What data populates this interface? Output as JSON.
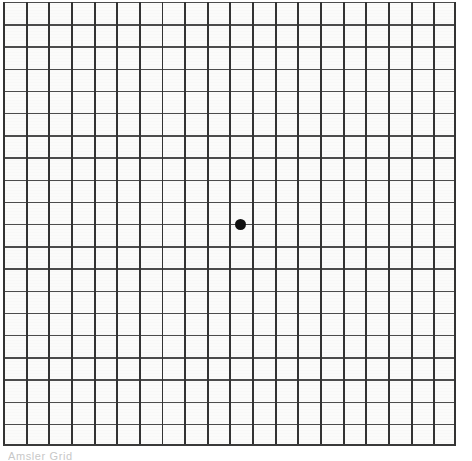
{
  "document": {
    "title": "Amsler Grid",
    "background_color": "#ffffff",
    "paper_color": "#fbfbfa"
  },
  "grid": {
    "name": "amsler-grid",
    "columns": 20,
    "rows": 20,
    "cell_width_px": 22.65,
    "cell_height_px": 22.2,
    "line_color_vertical": "#333333",
    "line_color_horizontal": "#4c4c4c",
    "left_px": 3,
    "top_px": 2,
    "width_px": 453,
    "height_px": 444
  },
  "fixation_dot": {
    "name": "center-fixation-dot",
    "color": "#111111",
    "diameter_px": 11,
    "center_x_px": 240,
    "center_y_px": 224
  },
  "caption": {
    "text": "Amsler Grid",
    "color": "#9a9a9a",
    "clipped": true
  },
  "chart_data": {
    "type": "heatmap",
    "title": "Amsler Grid",
    "xlabel": "",
    "ylabel": "",
    "categories": [
      "c1",
      "c2",
      "c3",
      "c4",
      "c5",
      "c6",
      "c7",
      "c8",
      "c9",
      "c10",
      "c11",
      "c12",
      "c13",
      "c14",
      "c15",
      "c16",
      "c17",
      "c18",
      "c19",
      "c20"
    ],
    "rows": [
      "r1",
      "r2",
      "r3",
      "r4",
      "r5",
      "r6",
      "r7",
      "r8",
      "r9",
      "r10",
      "r11",
      "r12",
      "r13",
      "r14",
      "r15",
      "r16",
      "r17",
      "r18",
      "r19",
      "r20"
    ],
    "grid": true,
    "legend": "none",
    "annotations": [
      {
        "label": "central fixation dot",
        "x": 10,
        "y": 10,
        "marker": "filled-circle",
        "color": "#111111"
      }
    ],
    "xlim": [
      0,
      20
    ],
    "ylim": [
      0,
      20
    ],
    "values": [
      [
        0,
        0,
        0,
        0,
        0,
        0,
        0,
        0,
        0,
        0,
        0,
        0,
        0,
        0,
        0,
        0,
        0,
        0,
        0,
        0
      ],
      [
        0,
        0,
        0,
        0,
        0,
        0,
        0,
        0,
        0,
        0,
        0,
        0,
        0,
        0,
        0,
        0,
        0,
        0,
        0,
        0
      ],
      [
        0,
        0,
        0,
        0,
        0,
        0,
        0,
        0,
        0,
        0,
        0,
        0,
        0,
        0,
        0,
        0,
        0,
        0,
        0,
        0
      ],
      [
        0,
        0,
        0,
        0,
        0,
        0,
        0,
        0,
        0,
        0,
        0,
        0,
        0,
        0,
        0,
        0,
        0,
        0,
        0,
        0
      ],
      [
        0,
        0,
        0,
        0,
        0,
        0,
        0,
        0,
        0,
        0,
        0,
        0,
        0,
        0,
        0,
        0,
        0,
        0,
        0,
        0
      ],
      [
        0,
        0,
        0,
        0,
        0,
        0,
        0,
        0,
        0,
        0,
        0,
        0,
        0,
        0,
        0,
        0,
        0,
        0,
        0,
        0
      ],
      [
        0,
        0,
        0,
        0,
        0,
        0,
        0,
        0,
        0,
        0,
        0,
        0,
        0,
        0,
        0,
        0,
        0,
        0,
        0,
        0
      ],
      [
        0,
        0,
        0,
        0,
        0,
        0,
        0,
        0,
        0,
        0,
        0,
        0,
        0,
        0,
        0,
        0,
        0,
        0,
        0,
        0
      ],
      [
        0,
        0,
        0,
        0,
        0,
        0,
        0,
        0,
        0,
        0,
        0,
        0,
        0,
        0,
        0,
        0,
        0,
        0,
        0,
        0
      ],
      [
        0,
        0,
        0,
        0,
        0,
        0,
        0,
        0,
        0,
        0,
        1,
        0,
        0,
        0,
        0,
        0,
        0,
        0,
        0,
        0
      ],
      [
        0,
        0,
        0,
        0,
        0,
        0,
        0,
        0,
        0,
        0,
        0,
        0,
        0,
        0,
        0,
        0,
        0,
        0,
        0,
        0
      ],
      [
        0,
        0,
        0,
        0,
        0,
        0,
        0,
        0,
        0,
        0,
        0,
        0,
        0,
        0,
        0,
        0,
        0,
        0,
        0,
        0
      ],
      [
        0,
        0,
        0,
        0,
        0,
        0,
        0,
        0,
        0,
        0,
        0,
        0,
        0,
        0,
        0,
        0,
        0,
        0,
        0,
        0
      ],
      [
        0,
        0,
        0,
        0,
        0,
        0,
        0,
        0,
        0,
        0,
        0,
        0,
        0,
        0,
        0,
        0,
        0,
        0,
        0,
        0
      ],
      [
        0,
        0,
        0,
        0,
        0,
        0,
        0,
        0,
        0,
        0,
        0,
        0,
        0,
        0,
        0,
        0,
        0,
        0,
        0,
        0
      ],
      [
        0,
        0,
        0,
        0,
        0,
        0,
        0,
        0,
        0,
        0,
        0,
        0,
        0,
        0,
        0,
        0,
        0,
        0,
        0,
        0
      ],
      [
        0,
        0,
        0,
        0,
        0,
        0,
        0,
        0,
        0,
        0,
        0,
        0,
        0,
        0,
        0,
        0,
        0,
        0,
        0,
        0
      ],
      [
        0,
        0,
        0,
        0,
        0,
        0,
        0,
        0,
        0,
        0,
        0,
        0,
        0,
        0,
        0,
        0,
        0,
        0,
        0,
        0
      ],
      [
        0,
        0,
        0,
        0,
        0,
        0,
        0,
        0,
        0,
        0,
        0,
        0,
        0,
        0,
        0,
        0,
        0,
        0,
        0,
        0
      ],
      [
        0,
        0,
        0,
        0,
        0,
        0,
        0,
        0,
        0,
        0,
        0,
        0,
        0,
        0,
        0,
        0,
        0,
        0,
        0,
        0
      ]
    ]
  }
}
